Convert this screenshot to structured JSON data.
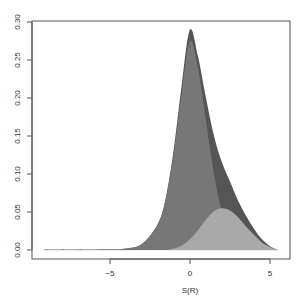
{
  "chart_data": {
    "type": "area",
    "title": "",
    "xlabel": "S(R)",
    "ylabel": "",
    "xlim": [
      -9.5,
      6
    ],
    "ylim": [
      0,
      0.3
    ],
    "x_ticks": [
      -5,
      0,
      5
    ],
    "x_tick_labels": [
      "−5",
      "0",
      "5"
    ],
    "y_ticks": [
      0.0,
      0.05,
      0.1,
      0.15,
      0.2,
      0.25,
      0.3
    ],
    "y_tick_labels": [
      "0.00",
      "0.05",
      "0.10",
      "0.15",
      "0.20",
      "0.25",
      "0.30"
    ],
    "grid": false,
    "legend": null,
    "series": [
      {
        "name": "total density (dark)",
        "color": "#555555",
        "x": [
          -9.2,
          -5,
          -4,
          -3,
          -2,
          -1.5,
          -1,
          -0.5,
          0,
          0.5,
          1,
          1.5,
          2,
          2.5,
          3,
          3.5,
          4,
          4.5,
          5,
          5.5
        ],
        "values": [
          0.0,
          0.0005,
          0.002,
          0.008,
          0.035,
          0.07,
          0.135,
          0.22,
          0.29,
          0.255,
          0.2,
          0.15,
          0.115,
          0.09,
          0.065,
          0.045,
          0.028,
          0.014,
          0.005,
          0.0
        ]
      },
      {
        "name": "component 1 (medium)",
        "color": "#777777",
        "x": [
          -9.2,
          -5,
          -4,
          -3,
          -2,
          -1.5,
          -1,
          -0.5,
          0,
          0.5,
          1,
          1.5,
          2,
          2.5,
          3,
          3.5,
          4
        ],
        "values": [
          0.0,
          0.0005,
          0.002,
          0.008,
          0.034,
          0.068,
          0.13,
          0.21,
          0.275,
          0.24,
          0.17,
          0.1,
          0.05,
          0.02,
          0.007,
          0.002,
          0.0
        ]
      },
      {
        "name": "component 2 (light)",
        "color": "#a9a9a9",
        "x": [
          -1.5,
          -1,
          -0.5,
          0,
          0.5,
          1,
          1.5,
          2,
          2.5,
          3,
          3.5,
          4,
          4.5,
          5,
          5.5
        ],
        "values": [
          0.0,
          0.002,
          0.006,
          0.014,
          0.026,
          0.04,
          0.051,
          0.055,
          0.052,
          0.043,
          0.031,
          0.02,
          0.01,
          0.004,
          0.0
        ]
      }
    ]
  }
}
